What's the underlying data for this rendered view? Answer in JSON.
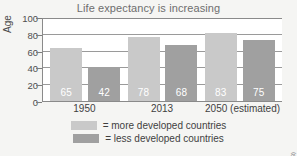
{
  "chart_data": {
    "type": "bar",
    "title": "Life expectancy is increasing",
    "xlabel": "",
    "ylabel": "Age",
    "ylim": [
      0,
      100
    ],
    "ytick_labels": [
      "100",
      "80",
      "60",
      "40",
      "20",
      "0"
    ],
    "ytick_values": [
      100,
      80,
      60,
      40,
      20,
      0
    ],
    "grid": true,
    "legend_position": "bottom",
    "categories": [
      "1950",
      "2013",
      "2050 (estimated)"
    ],
    "series": [
      {
        "name": "= more developed countries",
        "color": "#c9c9c9",
        "values": [
          65,
          78,
          83
        ],
        "value_labels": [
          "65",
          "78",
          "83"
        ]
      },
      {
        "name": "= less developed countries",
        "color": "#a0a0a0",
        "values": [
          42,
          68,
          75
        ],
        "value_labels": [
          "42",
          "68",
          "75"
        ]
      }
    ],
    "source": "(United Nations, 2013)"
  },
  "figure": {
    "title": "Life expectancy is increasing",
    "y_axis_label": "Age",
    "source_credit": "(United Nations, 2013)",
    "background_color": "#f5f5f3",
    "plot_background_color": "#ffffff"
  },
  "y_ticks": [
    {
      "label": "100",
      "value": 100
    },
    {
      "label": "80",
      "value": 80
    },
    {
      "label": "60",
      "value": 60
    },
    {
      "label": "40",
      "value": 40
    },
    {
      "label": "20",
      "value": 20
    },
    {
      "label": "0",
      "value": 0
    }
  ],
  "x_labels": [
    {
      "label": "1950"
    },
    {
      "label": "2013"
    },
    {
      "label": "2050 (estimated)"
    }
  ],
  "bars": [
    {
      "value": 65,
      "label": "65",
      "group": "1950",
      "series": "more"
    },
    {
      "value": 42,
      "label": "42",
      "group": "1950",
      "series": "less"
    },
    {
      "value": 78,
      "label": "78",
      "group": "2013",
      "series": "more"
    },
    {
      "value": 68,
      "label": "68",
      "group": "2013",
      "series": "less"
    },
    {
      "value": 83,
      "label": "83",
      "group": "2050 (estimated)",
      "series": "more"
    },
    {
      "value": 75,
      "label": "75",
      "group": "2050 (estimated)",
      "series": "less"
    }
  ],
  "legend": {
    "items": [
      {
        "label": "= more developed countries",
        "color": "#c9c9c9",
        "key": "more"
      },
      {
        "label": "= less developed countries",
        "color": "#a0a0a0",
        "key": "less"
      }
    ]
  }
}
